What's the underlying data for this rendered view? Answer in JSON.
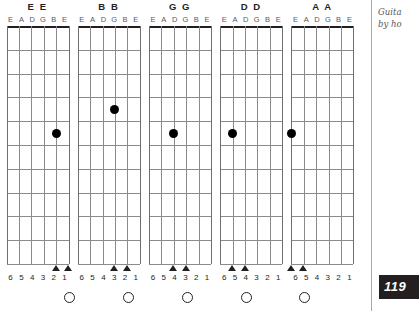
{
  "page": {
    "number": "119",
    "margin_note_line1": "Guita",
    "margin_note_line2": "by ho"
  },
  "fretboard": {
    "string_labels": [
      "E",
      "A",
      "D",
      "G",
      "B",
      "E"
    ],
    "string_numbers": [
      "6",
      "5",
      "4",
      "3",
      "2",
      "1"
    ],
    "fret_count": 10,
    "string_count": 6,
    "nut_color": "#231f20",
    "line_color": "#8b8b8d",
    "dot_color": "#000000"
  },
  "diagrams": [
    {
      "title": "E E",
      "note": "E",
      "dot": {
        "string": 2,
        "fret": 5
      },
      "triangles": [
        2,
        1
      ],
      "open_circle_string": 1
    },
    {
      "title": "B B",
      "note": "B",
      "dot": {
        "string": 3,
        "fret": 4
      },
      "triangles": [
        3,
        2
      ],
      "open_circle_string": 2
    },
    {
      "title": "G G",
      "note": "G",
      "dot": {
        "string": 4,
        "fret": 5
      },
      "triangles": [
        4,
        3
      ],
      "open_circle_string": 3
    },
    {
      "title": "D D",
      "note": "D",
      "dot": {
        "string": 5,
        "fret": 5
      },
      "triangles": [
        5,
        4
      ],
      "open_circle_string": 4
    },
    {
      "title": "A A",
      "note": "A",
      "dot": {
        "string": 6,
        "fret": 5
      },
      "triangles": [
        6,
        5
      ],
      "open_circle_string": 5
    }
  ]
}
